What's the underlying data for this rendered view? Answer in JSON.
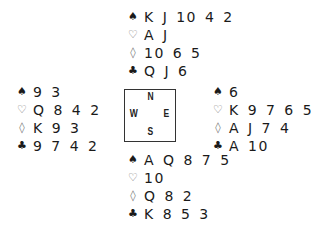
{
  "suits": {
    "spades": {
      "glyph": "♠",
      "icon": "spade-icon",
      "style": "filled"
    },
    "hearts": {
      "glyph": "♡",
      "icon": "heart-icon",
      "style": "outline"
    },
    "diamonds": {
      "glyph": "◊",
      "icon": "diamond-icon",
      "style": "outline"
    },
    "clubs": {
      "glyph": "♣",
      "icon": "club-icon",
      "style": "filled"
    }
  },
  "compass": {
    "north": "N",
    "west": "W",
    "east": "E",
    "south": "S"
  },
  "hands": {
    "north": {
      "spades": "K J 10 4 2",
      "hearts": "A J",
      "diamonds": "10 6 5",
      "clubs": "Q J 6"
    },
    "west": {
      "spades": "9 3",
      "hearts": "Q 8 4 2",
      "diamonds": "K 9 3",
      "clubs": "9 7 4 2"
    },
    "east": {
      "spades": "6",
      "hearts": "K 9 7 6 5 3",
      "diamonds": "A J 7 4",
      "clubs": "A 10"
    },
    "south": {
      "spades": "A Q 8 7 5",
      "hearts": "10",
      "diamonds": "Q 8 2",
      "clubs": "K 8 5 3"
    }
  }
}
